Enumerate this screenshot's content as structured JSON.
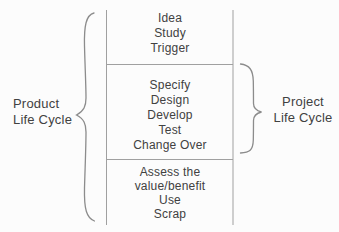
{
  "diagram": {
    "left_label": [
      "Product",
      "Life Cycle"
    ],
    "right_label": [
      "Project",
      "Life Cycle"
    ],
    "sections": [
      {
        "items": [
          "Idea",
          "Study",
          "Trigger"
        ]
      },
      {
        "items": [
          "Specify",
          "Design",
          "Develop",
          "Test",
          "Change Over"
        ]
      },
      {
        "items": [
          "Assess the",
          "value/benefit",
          "Use",
          "Scrap"
        ]
      }
    ],
    "colors": {
      "background": "#fcfcfc",
      "line": "#a0a0a0",
      "brace": "#8c8c8c",
      "text": "#414141"
    }
  }
}
